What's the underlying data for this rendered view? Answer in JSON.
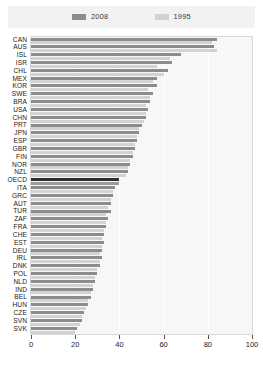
{
  "legend": {
    "position": "top",
    "entries": [
      {
        "label": "2008",
        "color": "#8c8c8c",
        "name": "legend-2008"
      },
      {
        "label": "1995",
        "color": "#d2d2d2",
        "name": "legend-1995"
      }
    ]
  },
  "axis": {
    "x_ticks": [
      "0",
      "20",
      "40",
      "60",
      "80",
      "100"
    ]
  },
  "chart_data": {
    "type": "bar",
    "orientation": "horizontal",
    "title": "",
    "subtitle": "",
    "xlabel": "",
    "ylabel": "",
    "xlim": [
      0,
      100
    ],
    "grid": true,
    "legend_position": "top",
    "highlight_category": "OECD",
    "categories": [
      "CAN",
      "AUS",
      "ISL",
      "ISR",
      "CHL",
      "MEX",
      "KOR",
      "SWE",
      "BRA",
      "USA",
      "CHN",
      "PRT",
      "JPN",
      "ESP",
      "GBR",
      "FIN",
      "NOR",
      "NZL",
      "OECD",
      "ITA",
      "GRC",
      "AUT",
      "TUR",
      "ZAF",
      "FRA",
      "CHE",
      "EST",
      "DEU",
      "IRL",
      "DNK",
      "POL",
      "NLD",
      "IND",
      "BEL",
      "HUN",
      "CZE",
      "SVN",
      "SVK"
    ],
    "series": [
      {
        "name": "2008",
        "color": "#8c8c8c",
        "values": [
          84,
          83,
          68,
          64,
          62,
          57,
          57,
          55,
          54,
          53,
          52,
          50,
          49,
          48,
          47,
          46,
          45,
          44,
          40,
          38,
          37,
          36,
          36,
          35,
          34,
          33,
          33,
          32,
          32,
          31,
          30,
          29,
          28,
          27,
          26,
          24,
          23,
          21
        ]
      },
      {
        "name": "1995",
        "color": "#d2d2d2",
        "values": [
          82,
          84,
          63,
          57,
          60,
          55,
          53,
          54,
          52,
          52,
          51,
          49,
          48,
          47,
          46,
          45,
          44,
          43,
          40,
          37,
          36,
          35,
          34,
          34,
          33,
          32,
          32,
          31,
          31,
          30,
          29,
          28,
          27,
          26,
          25,
          23,
          22,
          20
        ]
      }
    ]
  }
}
